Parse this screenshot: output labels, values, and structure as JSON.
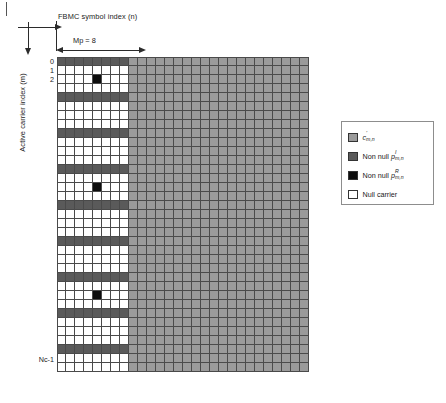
{
  "axes": {
    "x_caption": "FBMC symbol index (n)",
    "y_caption": "Active carrier index (m)"
  },
  "measure": {
    "mp_label": "Mp = 8",
    "mp_columns": 8
  },
  "row_labels": {
    "first": "0",
    "second": "1",
    "third": "2",
    "last": "Nc-1"
  },
  "legend": {
    "items": [
      {
        "name": "legend-c-mn",
        "label_prefix": "",
        "symbol": "c",
        "sup": "'",
        "sub": "m,n",
        "color": "#9a9a9a",
        "plain": "c'm,n"
      },
      {
        "name": "legend-non-null-pI",
        "label_prefix": "Non null",
        "symbol": "p",
        "sup": "I",
        "sub": "m,n",
        "color": "#5a5a5a",
        "plain": "Non null pIm,n"
      },
      {
        "name": "legend-non-null-pR",
        "label_prefix": "Non null",
        "symbol": "p",
        "sup": "R",
        "sub": "m,n",
        "color": "#0d0d0d",
        "plain": "Non null pRm,n"
      },
      {
        "name": "legend-null-carrier",
        "label_prefix": "Null carrier",
        "symbol": "",
        "sup": "",
        "sub": "",
        "color": "#ffffff",
        "plain": "Null carrier"
      }
    ]
  },
  "colors": {
    "data_gray": "#9a9a9a",
    "pilot_imag_gray": "#5a5a5a",
    "pilot_real_black": "#0d0d0d",
    "null_white": "#ffffff",
    "grid_line": "#4a4a4a"
  },
  "chart_data": {
    "type": "heatmap",
    "xlabel": "FBMC symbol index (n)",
    "ylabel": "Active carrier index (m)",
    "grid": true,
    "legend_position": "right",
    "rows": 35,
    "preamble_columns": 8,
    "data_columns": 20,
    "total_columns": 28,
    "row_tick_labels": {
      "0": "0",
      "1": "1",
      "2": "2",
      "34": "Nc-1"
    },
    "cell_categories": {
      "null": "#ffffff",
      "pilot_imag": "#5a5a5a",
      "pilot_real": "#0d0d0d",
      "data": "#9a9a9a"
    },
    "preamble_pilot_imag_rows": [
      0,
      4,
      8,
      12,
      16,
      20,
      24,
      28,
      32
    ],
    "preamble_pilot_real_cells": [
      {
        "row": 2,
        "col": 4
      },
      {
        "row": 14,
        "col": 4
      },
      {
        "row": 26,
        "col": 4
      }
    ]
  }
}
